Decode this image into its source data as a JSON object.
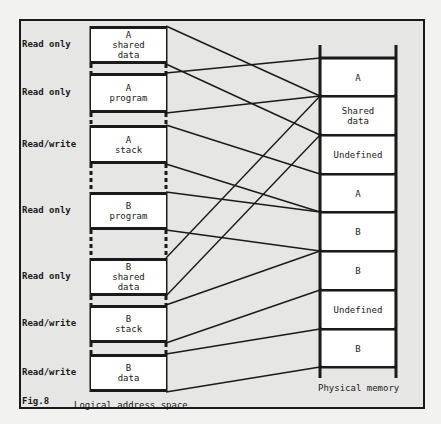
{
  "figure": {
    "label": "Fig.8",
    "left_caption": "Logical address space",
    "right_caption": "Physical memory"
  },
  "logical_segments": [
    {
      "permission": "Read only",
      "line1": "A",
      "line2": "shared",
      "line3": "data",
      "top": 26,
      "bottom": 64,
      "maps_to": 1
    },
    {
      "permission": "Read only",
      "line1": "A",
      "line2": "program",
      "line3": "",
      "top": 73,
      "bottom": 113,
      "maps_to": 0
    },
    {
      "permission": "Read/write",
      "line1": "A",
      "line2": "stack",
      "line3": "",
      "top": 125,
      "bottom": 164,
      "maps_to": 3
    },
    {
      "permission": "Read only",
      "line1": "B",
      "line2": "program",
      "line3": "",
      "top": 192,
      "bottom": 230,
      "maps_to": 4
    },
    {
      "permission": "Read only",
      "line1": "B",
      "line2": "shared",
      "line3": "data",
      "top": 258,
      "bottom": 296,
      "maps_to": 1
    },
    {
      "permission": "Read/write",
      "line1": "B",
      "line2": "stack",
      "line3": "",
      "top": 305,
      "bottom": 343,
      "maps_to": 5
    },
    {
      "permission": "Read/write",
      "line1": "B",
      "line2": "data",
      "line3": "",
      "top": 354,
      "bottom": 392,
      "maps_to": 7
    }
  ],
  "physical_blocks": [
    {
      "line1": "A",
      "line2": "",
      "top": 58,
      "bottom": 96
    },
    {
      "line1": "Shared",
      "line2": "data",
      "top": 96,
      "bottom": 135
    },
    {
      "line1": "Undefined",
      "line2": "",
      "top": 135,
      "bottom": 174
    },
    {
      "line1": "A",
      "line2": "",
      "top": 174,
      "bottom": 212
    },
    {
      "line1": "B",
      "line2": "",
      "top": 212,
      "bottom": 251
    },
    {
      "line1": "B",
      "line2": "",
      "top": 251,
      "bottom": 290
    },
    {
      "line1": "Undefined",
      "line2": "",
      "top": 290,
      "bottom": 329
    },
    {
      "line1": "B",
      "line2": "",
      "top": 329,
      "bottom": 367
    }
  ],
  "colors": {
    "ink": "#1a1a1a",
    "paper": "#e6e6e4",
    "box": "#ffffff"
  }
}
